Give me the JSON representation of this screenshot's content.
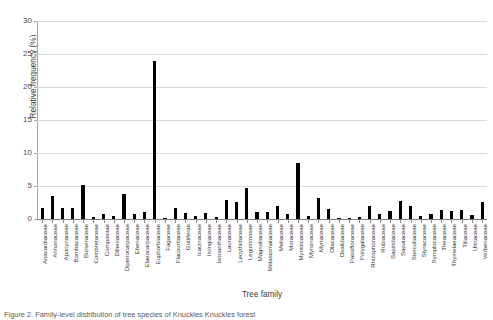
{
  "chart_data": {
    "type": "bar",
    "title": "",
    "xlabel": "Tree family",
    "ylabel": "Relative frequency (%)",
    "ylim": [
      0,
      30
    ],
    "yticks": [
      0,
      5,
      10,
      15,
      20,
      25,
      30
    ],
    "grid": true,
    "legend": null,
    "bar_color": "#000000",
    "categories": [
      "Anacardiaceae",
      "Annonaceae",
      "Apocynaceae",
      "Bombacaceae",
      "Burseraceae",
      "Combretaceae",
      "Compositae",
      "Dilleniaceae",
      "Dipterocarpaceae",
      "Ebenaceae",
      "Elaeocarpaceae",
      "Euphorbiaceae",
      "Fagaceae",
      "Flacourtiaceae",
      "Guttiferae",
      "Icacinaceae",
      "Irvingiaceae",
      "Ixonanthaceae",
      "Lauraceae",
      "Lecythidaceae",
      "Leguminosae",
      "Magnoliaceae",
      "Melastomataceae",
      "Meliaceae",
      "Moraceae",
      "Myristicaceae",
      "Myrsinaceae",
      "Myrtaceae",
      "Olacaceae",
      "Oxalidaceae",
      "Passifloraceae",
      "Polygalaceae",
      "Rhizophoraceae",
      "Rubiaceae",
      "Sapindaceae",
      "Sapotaceae",
      "Sterculiaceae",
      "Styracaceae",
      "Symplocaceae",
      "Theaceae",
      "Thymelaeaceae",
      "Tiliaceae",
      "Ulmaceae",
      "Verbenaceae"
    ],
    "values": [
      1.6,
      3.5,
      1.7,
      1.7,
      5.2,
      0.3,
      0.8,
      0.5,
      3.8,
      0.7,
      1.0,
      24.0,
      0.2,
      1.6,
      0.9,
      0.4,
      0.9,
      0.3,
      2.9,
      2.6,
      4.7,
      1.0,
      1.0,
      2.0,
      0.8,
      8.5,
      0.5,
      3.2,
      1.5,
      0.2,
      0.2,
      0.3,
      2.0,
      0.8,
      1.2,
      2.7,
      2.0,
      0.5,
      0.7,
      1.3,
      1.2,
      1.3,
      0.6,
      2.6
    ],
    "ylabel_unit": "%"
  },
  "caption": {
    "text": "Figure 2. Family-level distribution of tree species of Knuckles Knuckles forest"
  }
}
